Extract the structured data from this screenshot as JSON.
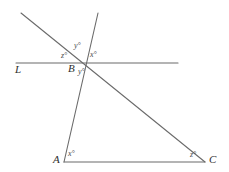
{
  "figure": {
    "kind": "geometry-diagram",
    "width": 229,
    "height": 172,
    "background_color": "#ffffff",
    "stroke_color": "#6b6b6b",
    "text_color": "#3a3a3a"
  },
  "labels": {
    "line_L": "L",
    "point_B": "B",
    "point_A": "A",
    "point_C": "C",
    "angle_z_at_B_upper_left": "z°",
    "angle_y_at_B_above": "y°",
    "angle_x_at_B_upper_right": "x°",
    "angle_y_at_B_below": "y°",
    "angle_x_at_A": "x°",
    "angle_z_at_C": "z°"
  },
  "geometry": {
    "points": {
      "A": {
        "x": 64,
        "y": 162
      },
      "B": {
        "x": 82,
        "y": 63
      },
      "C": {
        "x": 205,
        "y": 162
      },
      "L_left_end": {
        "x": 16,
        "y": 63
      },
      "L_right_end": {
        "x": 178,
        "y": 63
      },
      "transversal_AC_top": {
        "x": 21,
        "y": 13
      },
      "transversal_AB_top": {
        "x": 98,
        "y": 13
      }
    },
    "segments": [
      {
        "name": "line-L",
        "from": "L_left_end",
        "to": "L_right_end"
      },
      {
        "name": "line-through-B-to-C",
        "from": "transversal_AC_top",
        "to": "C"
      },
      {
        "name": "line-through-B-to-A",
        "from": "transversal_AB_top",
        "to": "A"
      },
      {
        "name": "segment-AC",
        "from": "A",
        "to": "C"
      }
    ]
  }
}
